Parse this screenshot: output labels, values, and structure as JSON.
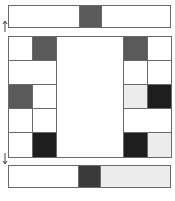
{
  "colors": {
    "white": "#ffffff",
    "light": "#ececec",
    "gray": "#5a5a5a",
    "dark": "#3a3a3a",
    "black": "#1e1e1e",
    "line": "#6a6a6a"
  },
  "top_bar": {
    "segments": [
      {
        "fill": "white",
        "fraction": 0.435
      },
      {
        "fill": "gray",
        "fraction": 0.14
      },
      {
        "fill": "white",
        "fraction": 0.425
      }
    ]
  },
  "bottom_bar": {
    "segments": [
      {
        "fill": "white",
        "fraction": 0.43
      },
      {
        "fill": "dark",
        "fraction": 0.14
      },
      {
        "fill": "light",
        "fraction": 0.43
      }
    ]
  },
  "grid": {
    "left_column": [
      {
        "cells": [
          "white",
          "gray"
        ]
      },
      {
        "cells": [
          "white"
        ]
      },
      {
        "cells": [
          "gray",
          "white"
        ]
      },
      {
        "cells": [
          "white",
          "white"
        ]
      },
      {
        "cells": [
          "white",
          "black"
        ]
      }
    ],
    "right_column": [
      {
        "cells": [
          "gray",
          "white"
        ]
      },
      {
        "cells": [
          "white",
          "white"
        ]
      },
      {
        "cells": [
          "light",
          "black"
        ]
      },
      {
        "cells": [
          "white"
        ]
      },
      {
        "cells": [
          "black",
          "light"
        ]
      }
    ],
    "center": "empty"
  },
  "arrows": {
    "top": "arrow-up-icon",
    "bottom": "arrow-down-icon"
  }
}
